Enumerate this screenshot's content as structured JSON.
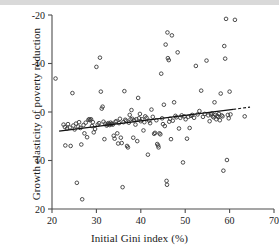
{
  "figure": {
    "background_color": "#ffffff",
    "top_band_color": "#d9d9d9",
    "axis_color": "#4d4d4d",
    "marker_color": "#3a3a3a",
    "line_color": "#111111"
  },
  "axis": {
    "x_title": "Initial Gini index (%)",
    "y_title": "Growth elasticity of poverty reduction",
    "x_ticks": [
      "20",
      "30",
      "40",
      "50",
      "60",
      "70"
    ],
    "y_ticks": [
      "20",
      "10",
      "0",
      "-10",
      "-20"
    ]
  },
  "chart_data": {
    "type": "scatter",
    "title": "",
    "xlabel": "Initial Gini index (%)",
    "ylabel": "Growth elasticity of poverty reduction",
    "xlim": [
      20,
      70
    ],
    "ylim": [
      -20,
      20
    ],
    "xticks": [
      20,
      30,
      40,
      50,
      60,
      70
    ],
    "yticks": [
      -20,
      -10,
      0,
      10,
      20
    ],
    "grid": false,
    "legend": "none",
    "marker": {
      "style": "open-circle",
      "size_px": 3.6,
      "edge_color": "#3a3a3a",
      "fill": "none"
    },
    "trendline": {
      "style": "solid-with-dashed-extension",
      "solid_x": [
        21.6,
        60.8
      ],
      "solid_y": [
        -3.95,
        0.55
      ],
      "dashed_x": [
        60.8,
        64.6
      ],
      "dashed_y": [
        0.55,
        1.0
      ],
      "color": "#111111",
      "description": "Upward sloping fitted regression line, dashed beyond last data cluster"
    },
    "points": [
      [
        20.8,
        6.9
      ],
      [
        22.6,
        -2.6
      ],
      [
        22.9,
        -3.1
      ],
      [
        23.0,
        -6.9
      ],
      [
        23.4,
        -3.4
      ],
      [
        23.6,
        -2.5
      ],
      [
        24.0,
        -3.2
      ],
      [
        24.2,
        -7.0
      ],
      [
        24.6,
        3.9
      ],
      [
        24.8,
        -2.8
      ],
      [
        25.1,
        -3.6
      ],
      [
        25.4,
        -2.4
      ],
      [
        25.6,
        -14.6
      ],
      [
        25.9,
        -3.0
      ],
      [
        26.1,
        -2.1
      ],
      [
        26.4,
        -3.3
      ],
      [
        26.6,
        -6.7
      ],
      [
        26.8,
        -18.0
      ],
      [
        27.1,
        -2.7
      ],
      [
        27.3,
        -4.4
      ],
      [
        27.6,
        -2.2
      ],
      [
        27.9,
        -5.2
      ],
      [
        28.2,
        -1.6
      ],
      [
        28.4,
        -1.5
      ],
      [
        28.6,
        -1.7
      ],
      [
        28.8,
        -1.5
      ],
      [
        29.0,
        -2.9
      ],
      [
        29.2,
        -2.1
      ],
      [
        29.4,
        -4.2
      ],
      [
        29.7,
        -3.5
      ],
      [
        30.0,
        9.3
      ],
      [
        30.3,
        -2.6
      ],
      [
        30.6,
        -2.3
      ],
      [
        30.8,
        11.2
      ],
      [
        31.0,
        4.2
      ],
      [
        31.2,
        0.7
      ],
      [
        31.4,
        1.1
      ],
      [
        31.6,
        -2.0
      ],
      [
        31.8,
        -5.6
      ],
      [
        32.0,
        -2.4
      ],
      [
        32.3,
        -2.8
      ],
      [
        32.5,
        -2.6
      ],
      [
        32.7,
        -2.3
      ],
      [
        32.9,
        -2.5
      ],
      [
        33.0,
        -2.7
      ],
      [
        33.2,
        -2.2
      ],
      [
        33.4,
        -2.5
      ],
      [
        33.5,
        -2.4
      ],
      [
        33.7,
        -2.6
      ],
      [
        33.9,
        -4.9
      ],
      [
        34.1,
        -5.5
      ],
      [
        34.3,
        -2.0
      ],
      [
        34.5,
        -1.9
      ],
      [
        34.7,
        -4.4
      ],
      [
        34.9,
        -6.5
      ],
      [
        35.1,
        -2.3
      ],
      [
        35.3,
        -1.4
      ],
      [
        35.5,
        -5.3
      ],
      [
        35.7,
        -6.4
      ],
      [
        35.9,
        -15.5
      ],
      [
        36.1,
        -2.1
      ],
      [
        36.3,
        4.3
      ],
      [
        36.5,
        -1.6
      ],
      [
        36.7,
        -1.8
      ],
      [
        36.9,
        -7.0
      ],
      [
        37.1,
        -7.3
      ],
      [
        37.3,
        -2.2
      ],
      [
        37.5,
        -0.6
      ],
      [
        37.7,
        -1.5
      ],
      [
        37.9,
        0.4
      ],
      [
        38.1,
        -1.4
      ],
      [
        38.3,
        -5.3
      ],
      [
        38.5,
        -1.7
      ],
      [
        38.8,
        -2.6
      ],
      [
        39.0,
        -1.5
      ],
      [
        39.2,
        -6.0
      ],
      [
        39.4,
        2.9
      ],
      [
        39.6,
        -1.3
      ],
      [
        39.8,
        -0.4
      ],
      [
        40.0,
        -1.9
      ],
      [
        40.3,
        -1.5
      ],
      [
        40.6,
        -3.8
      ],
      [
        40.8,
        -2.1
      ],
      [
        41.0,
        -0.9
      ],
      [
        41.3,
        -1.2
      ],
      [
        41.6,
        -8.8
      ],
      [
        41.9,
        -1.8
      ],
      [
        42.1,
        -2.3
      ],
      [
        42.4,
        0.5
      ],
      [
        42.7,
        -1.0
      ],
      [
        43.0,
        -4.5
      ],
      [
        43.2,
        -4.3
      ],
      [
        43.5,
        -1.7
      ],
      [
        43.7,
        -6.6
      ],
      [
        43.9,
        -6.9
      ],
      [
        44.0,
        -7.3
      ],
      [
        44.2,
        -4.4
      ],
      [
        44.4,
        -4.6
      ],
      [
        44.6,
        7.9
      ],
      [
        44.8,
        -1.3
      ],
      [
        45.0,
        -2.5
      ],
      [
        45.2,
        1.5
      ],
      [
        45.4,
        -2.9
      ],
      [
        45.6,
        13.9
      ],
      [
        45.8,
        -14.2
      ],
      [
        45.9,
        -15.0
      ],
      [
        46.0,
        16.4
      ],
      [
        46.1,
        11.1
      ],
      [
        46.3,
        10.7
      ],
      [
        46.4,
        -2.0
      ],
      [
        46.6,
        -1.4
      ],
      [
        46.8,
        -5.6
      ],
      [
        47.0,
        15.8
      ],
      [
        47.2,
        -1.8
      ],
      [
        47.5,
        2.0
      ],
      [
        47.8,
        -0.8
      ],
      [
        48.0,
        -1.1
      ],
      [
        48.3,
        12.3
      ],
      [
        48.6,
        -3.4
      ],
      [
        48.9,
        -1.2
      ],
      [
        49.2,
        -0.7
      ],
      [
        49.5,
        -10.4
      ],
      [
        49.8,
        -0.9
      ],
      [
        50.1,
        -1.5
      ],
      [
        50.4,
        -5.5
      ],
      [
        50.7,
        -1.0
      ],
      [
        51.0,
        -3.3
      ],
      [
        51.3,
        -0.8
      ],
      [
        51.6,
        -0.6
      ],
      [
        52.0,
        -1.2
      ],
      [
        52.4,
        9.5
      ],
      [
        52.8,
        -0.5
      ],
      [
        53.2,
        0.2
      ],
      [
        53.6,
        4.4
      ],
      [
        54.0,
        -1.0
      ],
      [
        54.4,
        -0.4
      ],
      [
        54.8,
        10.6
      ],
      [
        55.2,
        -0.7
      ],
      [
        55.5,
        -1.9
      ],
      [
        55.8,
        -0.5
      ],
      [
        56.0,
        -0.3
      ],
      [
        56.2,
        -0.9
      ],
      [
        56.4,
        -1.1
      ],
      [
        56.6,
        2.0
      ],
      [
        56.8,
        -0.6
      ],
      [
        57.0,
        -1.5
      ],
      [
        57.2,
        -0.8
      ],
      [
        57.4,
        -1.0
      ],
      [
        57.6,
        -0.4
      ],
      [
        57.8,
        -1.7
      ],
      [
        58.0,
        3.8
      ],
      [
        58.2,
        -0.7
      ],
      [
        58.4,
        -0.9
      ],
      [
        58.6,
        -12.1
      ],
      [
        58.8,
        13.6
      ],
      [
        59.0,
        11.0
      ],
      [
        59.2,
        19.2
      ],
      [
        59.4,
        -9.9
      ],
      [
        59.6,
        -0.6
      ],
      [
        59.8,
        -1.3
      ],
      [
        60.0,
        4.2
      ],
      [
        60.2,
        -0.5
      ],
      [
        61.2,
        19.0
      ],
      [
        63.4,
        -0.9
      ]
    ]
  }
}
